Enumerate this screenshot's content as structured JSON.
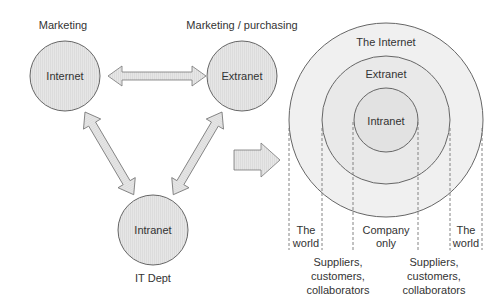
{
  "left_diagram": {
    "nodes": [
      {
        "id": "internet",
        "label": "Internet",
        "caption": "Marketing"
      },
      {
        "id": "extranet",
        "label": "Extranet",
        "caption": "Marketing / purchasing"
      },
      {
        "id": "intranet",
        "label": "Intranet",
        "caption": "IT Dept"
      }
    ],
    "arrows": [
      {
        "from": "internet",
        "to": "extranet",
        "type": "bidirectional"
      },
      {
        "from": "internet",
        "to": "intranet",
        "type": "bidirectional"
      },
      {
        "from": "extranet",
        "to": "intranet",
        "type": "bidirectional"
      }
    ]
  },
  "transition_arrow": {
    "direction": "right"
  },
  "right_diagram": {
    "rings": [
      {
        "id": "the-internet",
        "label": "The Internet"
      },
      {
        "id": "extranet",
        "label": "Extranet"
      },
      {
        "id": "intranet",
        "label": "Intranet"
      }
    ],
    "zones": {
      "world_left": [
        "The",
        "world"
      ],
      "company": [
        "Company",
        "only"
      ],
      "world_right": [
        "The",
        "world"
      ],
      "partners_left": [
        "Suppliers,",
        "customers,",
        "collaborators"
      ],
      "partners_right": [
        "Suppliers,",
        "customers,",
        "collaborators"
      ]
    }
  },
  "colors": {
    "circle_fill": "#e6e6e6",
    "stroke": "#666666",
    "text": "#333333",
    "arrow_fill": "#e2e2e2"
  }
}
